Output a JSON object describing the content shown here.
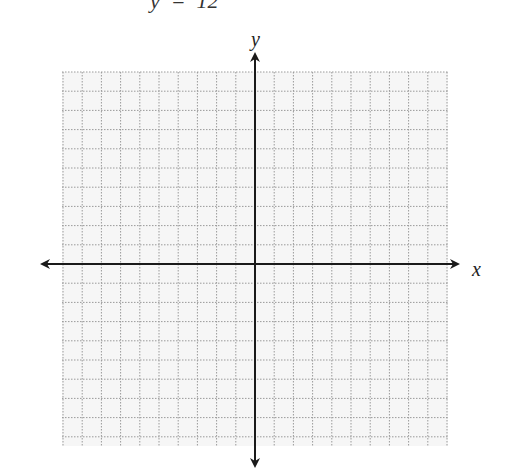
{
  "header": {
    "equation_fragment": "y  =  12"
  },
  "graph": {
    "x_axis_label": "x",
    "y_axis_label": "y",
    "grid": {
      "left": 62,
      "top": 72,
      "right": 448,
      "bottom": 446,
      "spacing": 19.2,
      "style": "dotted"
    },
    "origin": {
      "x": 255,
      "y": 264
    },
    "colors": {
      "grid_bg": "#f6f6f6",
      "grid_line": "#9a9a9a",
      "axis": "#1a1a1a"
    }
  }
}
